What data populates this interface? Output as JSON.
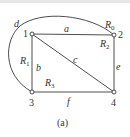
{
  "diagram": {
    "type": "planar-graph",
    "caption": "(a)",
    "nodes": [
      {
        "id": "1",
        "label": "1",
        "x": 32,
        "y": 34
      },
      {
        "id": "2",
        "label": "2",
        "x": 114,
        "y": 35
      },
      {
        "id": "3",
        "label": "3",
        "x": 32,
        "y": 92
      },
      {
        "id": "4",
        "label": "4",
        "x": 114,
        "y": 92
      }
    ],
    "edges": [
      {
        "id": "a",
        "label": "a",
        "from": "1",
        "to": "2"
      },
      {
        "id": "b",
        "label": "b",
        "from": "1",
        "to": "3"
      },
      {
        "id": "c",
        "label": "c",
        "from": "1",
        "to": "4"
      },
      {
        "id": "d",
        "label": "d",
        "from": "3",
        "to": "2",
        "curved": true
      },
      {
        "id": "e",
        "label": "e",
        "from": "2",
        "to": "4"
      },
      {
        "id": "f",
        "label": "f",
        "from": "3",
        "to": "4"
      }
    ],
    "regions": [
      {
        "id": "R0",
        "base": "R",
        "sub": "0"
      },
      {
        "id": "R1",
        "base": "R",
        "sub": "1"
      },
      {
        "id": "R2",
        "base": "R",
        "sub": "2"
      },
      {
        "id": "R3",
        "base": "R",
        "sub": "3"
      }
    ]
  }
}
